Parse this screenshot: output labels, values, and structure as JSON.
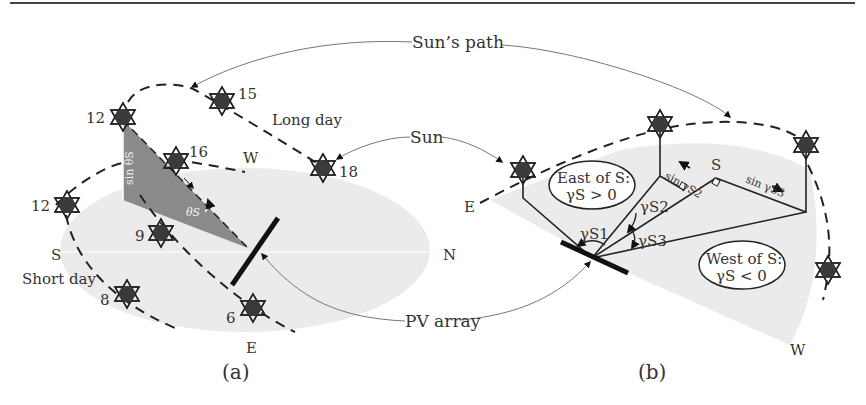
{
  "figure": {
    "top_rule": true,
    "colors": {
      "ground": "#ebebeb",
      "shadow_triangle": "#8a8a8a",
      "sun_fill": "#3a3a3a",
      "line": "#222222",
      "callout_line": "#777777"
    },
    "callouts": {
      "suns_path": "Sun’s path",
      "sun": "Sun",
      "pv_array": "PV array"
    },
    "panel_a": {
      "caption": "(a)",
      "compass": {
        "south": "S",
        "north": "N",
        "east": "E",
        "west": "W"
      },
      "path_labels": {
        "long_day": "Long day",
        "short_day": "Short day"
      },
      "long_day_hours": [
        "12",
        "15",
        "16",
        "18"
      ],
      "short_day_hours": [
        "12",
        "9",
        "8",
        "6"
      ],
      "angle_label": "θS",
      "side_label": "sin θS"
    },
    "panel_b": {
      "caption": "(b)",
      "compass": {
        "east": "E",
        "west": "W",
        "south": "S"
      },
      "east_box": {
        "line1": "East of S:",
        "line2": "γS > 0"
      },
      "west_box": {
        "line1": "West of S:",
        "line2": "γS < 0"
      },
      "angles": [
        "γS1",
        "γS2",
        "γS3"
      ],
      "projections": [
        "sin γS2",
        "sin γS3"
      ]
    }
  }
}
